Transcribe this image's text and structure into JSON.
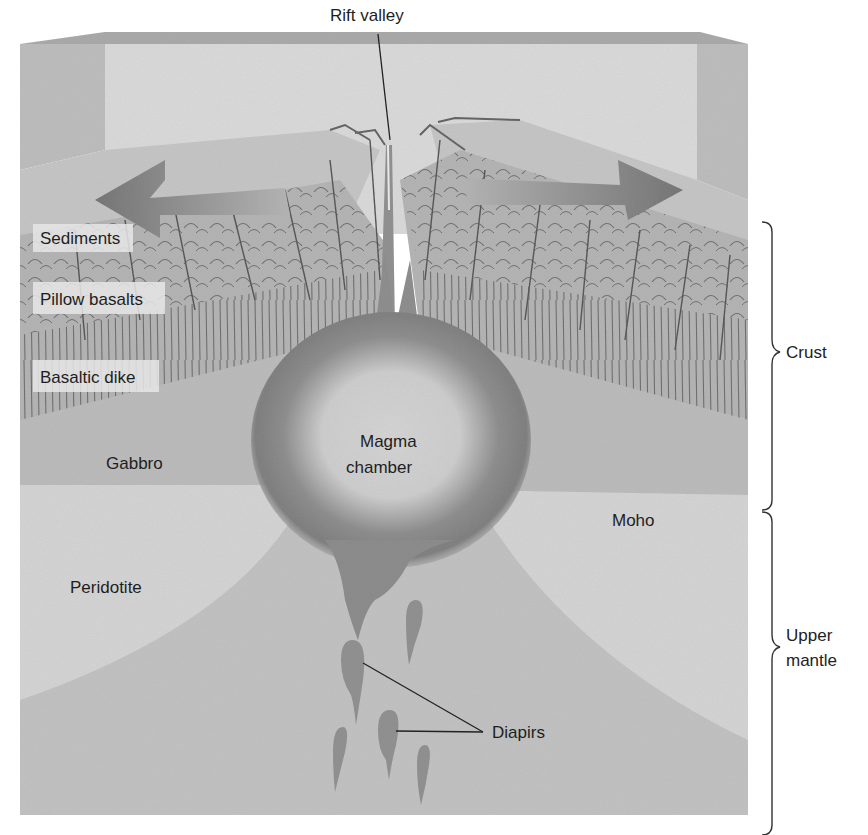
{
  "diagram": {
    "title_labels": {
      "rift_valley": "Rift valley"
    },
    "layer_labels": {
      "sediments": "Sediments",
      "pillow_basalts": "Pillow basalts",
      "basaltic_dike": "Basaltic dike",
      "gabbro": "Gabbro",
      "peridotite": "Peridotite",
      "moho": "Moho"
    },
    "feature_labels": {
      "magma_chamber_line1": "Magma",
      "magma_chamber_line2": "chamber",
      "diapirs": "Diapirs"
    },
    "bracket_labels": {
      "crust": "Crust",
      "upper_mantle_line1": "Upper",
      "upper_mantle_line2": "mantle"
    },
    "arrows": [
      {
        "direction": "left",
        "meaning": "plate spreading"
      },
      {
        "direction": "right",
        "meaning": "plate spreading"
      }
    ],
    "colors": {
      "background": "#ffffff",
      "back_wall": "#d9d9d9",
      "side_wall": "#bdbdbd",
      "top_surface": "#c4c4c4",
      "crust_layers": "#b3b3b3",
      "gabbro": "#bcbcbc",
      "peridotite": "#d6d6d6",
      "mantle": "#c2c2c2",
      "magma_dark": "#7e7e7e",
      "magma_light": "#d0d0d0",
      "label_box": "#dedede",
      "text": "#1e1e1e"
    }
  }
}
